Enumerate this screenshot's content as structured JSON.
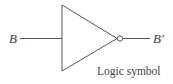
{
  "diagram": {
    "type": "logic-gate",
    "gate": "NOT (inverter)",
    "input_label": "B",
    "output_label": "B′",
    "caption": "Logic symbol",
    "colors": {
      "stroke": "#555555",
      "text": "#3a3a3a",
      "background": "#ffffff"
    }
  }
}
